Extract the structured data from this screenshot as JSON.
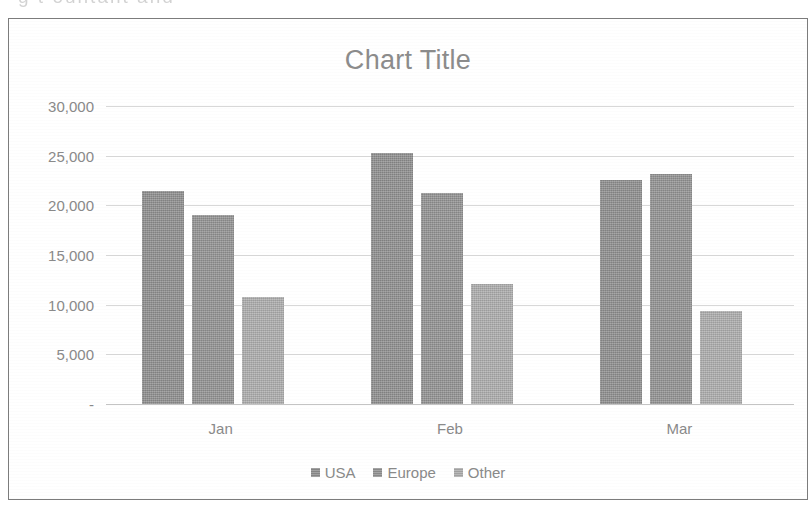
{
  "page": {
    "top_cut_text": "g          t   ountant and"
  },
  "chart_data": {
    "type": "bar",
    "title": "Chart Title",
    "xlabel": "",
    "ylabel": "",
    "categories": [
      "Jan",
      "Feb",
      "Mar"
    ],
    "series": [
      {
        "name": "USA",
        "color": "#8d8d8d",
        "values": [
          21400,
          25250,
          22550
        ]
      },
      {
        "name": "Europe",
        "color": "#919191",
        "values": [
          19050,
          21200,
          23200
        ]
      },
      {
        "name": "Other",
        "color": "#ababab",
        "values": [
          10800,
          12100,
          9400
        ]
      }
    ],
    "ylim": [
      0,
      30000
    ],
    "y_ticks": [
      0,
      5000,
      10000,
      15000,
      20000,
      25000,
      30000
    ],
    "y_tick_labels": [
      "-",
      "5,000",
      "10,000",
      "15,000",
      "20,000",
      "25,000",
      "30,000"
    ],
    "grid": true,
    "legend_position": "bottom",
    "plot_background": "#ffffff",
    "gridline_color": "#d8d8d8",
    "text_color": "#8a8a8a"
  }
}
